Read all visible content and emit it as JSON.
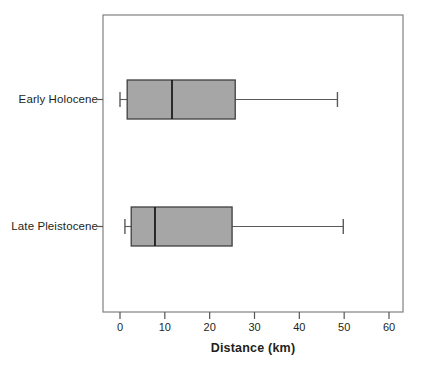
{
  "chart_data": {
    "type": "box",
    "title": "",
    "xlabel": "Distance (km)",
    "ylabel": "",
    "orientation": "horizontal",
    "xlim": [
      -4.5,
      63
    ],
    "xticks": [
      0,
      10,
      20,
      30,
      40,
      50,
      60
    ],
    "xticklabels": [
      "0",
      "10",
      "20",
      "30",
      "40",
      "50",
      "60"
    ],
    "grid": false,
    "legend": false,
    "categories": [
      "Early Holocene",
      "Late Pleistocene"
    ],
    "boxes": [
      {
        "label": "Early Holocene",
        "whisker_low": 0.0,
        "q1": 1.6,
        "median": 11.6,
        "q3": 25.7,
        "whisker_high": 48.5,
        "fill": "#a6a6a6",
        "stroke": "#3f3f3f"
      },
      {
        "label": "Late Pleistocene",
        "whisker_low": 1.1,
        "q1": 2.5,
        "median": 7.8,
        "q3": 25.0,
        "whisker_high": 49.8,
        "fill": "#a6a6a6",
        "stroke": "#3f3f3f"
      }
    ]
  },
  "style": {
    "frame_color": "#808080",
    "tick_color": "#555555",
    "box_fill": "#a6a6a6",
    "box_stroke": "#3f3f3f",
    "background": "#ffffff"
  },
  "axis": {
    "x_title": "Distance (km)",
    "tick_0": "0",
    "tick_10": "10",
    "tick_20": "20",
    "tick_30": "30",
    "tick_40": "40",
    "tick_50": "50",
    "tick_60": "60"
  },
  "categories": {
    "early_holocene": "Early Holocene",
    "late_pleistocene": "Late Pleistocene"
  }
}
